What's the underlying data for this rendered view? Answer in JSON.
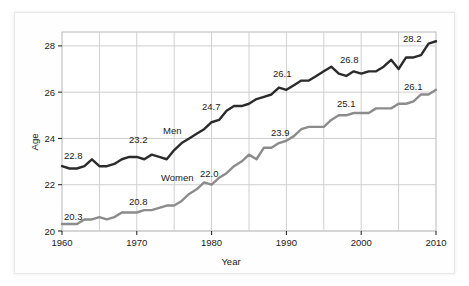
{
  "figure": {
    "background_color": "#ffffff",
    "frame_color": "#e8e8e8"
  },
  "axes": {
    "y_title": "Age",
    "x_title": "Year",
    "y_ticks": [
      "20",
      "22",
      "24",
      "26",
      "28"
    ],
    "x_ticks": [
      "1960",
      "1970",
      "1980",
      "1990",
      "2000",
      "2010"
    ],
    "grid": "on",
    "grid_color": "#cfcfcf"
  },
  "series_labels": {
    "men": "Men",
    "women": "Women"
  },
  "annotations": {
    "men": [
      "22.8",
      "23.2",
      "24.7",
      "26.1",
      "26.8",
      "28.2"
    ],
    "women": [
      "20.3",
      "20.8",
      "22.0",
      "23.9",
      "25.1",
      "26.1"
    ]
  },
  "colors": {
    "men_line": "#2b2b2b",
    "women_line": "#8c8c8c",
    "grid": "#cfcfcf",
    "text": "#1a1a1a"
  },
  "chart_data": {
    "type": "line",
    "title": "",
    "xlabel": "Year",
    "ylabel": "Age",
    "xlim": [
      1960,
      2010
    ],
    "ylim": [
      20,
      28.6
    ],
    "grid": "on",
    "legend": "inline-labels",
    "x": [
      1960,
      1961,
      1962,
      1963,
      1964,
      1965,
      1966,
      1967,
      1968,
      1969,
      1970,
      1971,
      1972,
      1973,
      1974,
      1975,
      1976,
      1977,
      1978,
      1979,
      1980,
      1981,
      1982,
      1983,
      1984,
      1985,
      1986,
      1987,
      1988,
      1989,
      1990,
      1991,
      1992,
      1993,
      1994,
      1995,
      1996,
      1997,
      1998,
      1999,
      2000,
      2001,
      2002,
      2003,
      2004,
      2005,
      2006,
      2007,
      2008,
      2009,
      2010
    ],
    "series": [
      {
        "name": "Men",
        "color": "#2b2b2b",
        "values": [
          22.8,
          22.7,
          22.7,
          22.8,
          23.1,
          22.8,
          22.8,
          22.9,
          23.1,
          23.2,
          23.2,
          23.1,
          23.3,
          23.2,
          23.1,
          23.5,
          23.8,
          24.0,
          24.2,
          24.4,
          24.7,
          24.8,
          25.2,
          25.4,
          25.4,
          25.5,
          25.7,
          25.8,
          25.9,
          26.2,
          26.1,
          26.3,
          26.5,
          26.5,
          26.7,
          26.9,
          27.1,
          26.8,
          26.7,
          26.9,
          26.8,
          26.9,
          26.9,
          27.1,
          27.4,
          27.0,
          27.5,
          27.5,
          27.6,
          28.1,
          28.2
        ]
      },
      {
        "name": "Women",
        "color": "#8c8c8c",
        "values": [
          20.3,
          20.3,
          20.3,
          20.5,
          20.5,
          20.6,
          20.5,
          20.6,
          20.8,
          20.8,
          20.8,
          20.9,
          20.9,
          21.0,
          21.1,
          21.1,
          21.3,
          21.6,
          21.8,
          22.1,
          22.0,
          22.3,
          22.5,
          22.8,
          23.0,
          23.3,
          23.1,
          23.6,
          23.6,
          23.8,
          23.9,
          24.1,
          24.4,
          24.5,
          24.5,
          24.5,
          24.8,
          25.0,
          25.0,
          25.1,
          25.1,
          25.1,
          25.3,
          25.3,
          25.3,
          25.5,
          25.5,
          25.6,
          25.9,
          25.9,
          26.1
        ]
      }
    ]
  }
}
